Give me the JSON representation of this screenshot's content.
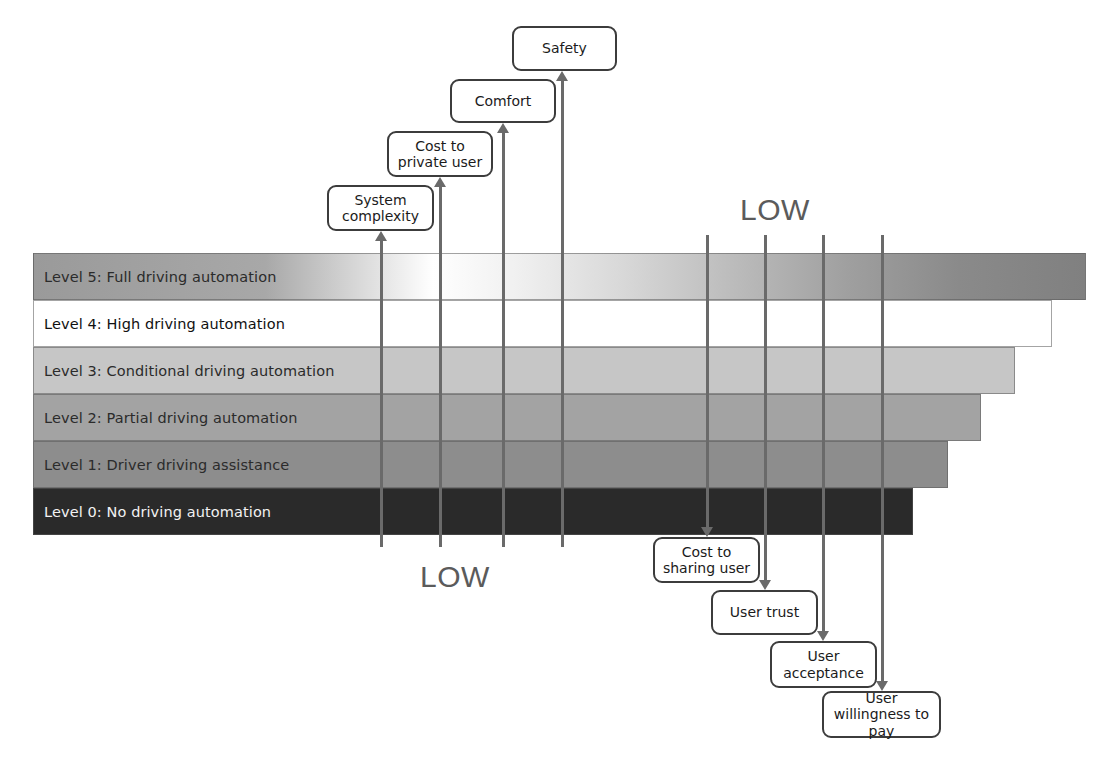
{
  "diagram": {
    "levels": [
      {
        "id": "level-5",
        "label": "Level 5: Full driving automation",
        "text_color": "#2b2b2b",
        "right": 1086,
        "gradient": true
      },
      {
        "id": "level-4",
        "label": "Level 4: High driving automation",
        "text_color": "#111111",
        "right": 1052,
        "fill": "#ffffff"
      },
      {
        "id": "level-3",
        "label": "Level 3: Conditional driving automation",
        "text_color": "#2b2b2b",
        "right": 1015,
        "fill": "#c6c6c6"
      },
      {
        "id": "level-2",
        "label": "Level 2: Partial driving automation",
        "text_color": "#2b2b2b",
        "right": 981,
        "fill": "#a3a3a3"
      },
      {
        "id": "level-1",
        "label": "Level 1: Driver driving assistance",
        "text_color": "#2b2b2b",
        "right": 948,
        "fill": "#8d8d8d"
      },
      {
        "id": "level-0",
        "label": "Level 0: No driving automation",
        "text_color": "#f2f2f2",
        "right": 913,
        "fill": "#2a2a2a"
      }
    ],
    "top_factors": [
      {
        "id": "system-complexity",
        "label": "System complexity",
        "x": 327,
        "y": 185,
        "w": 107,
        "h": 46,
        "line_x": 381
      },
      {
        "id": "cost-private-user",
        "label": "Cost to private user",
        "x": 387,
        "y": 131,
        "w": 106,
        "h": 46,
        "line_x": 440
      },
      {
        "id": "comfort",
        "label": "Comfort",
        "x": 450,
        "y": 79,
        "w": 106,
        "h": 44,
        "line_x": 503
      },
      {
        "id": "safety",
        "label": "Safety",
        "x": 512,
        "y": 26,
        "w": 105,
        "h": 45,
        "line_x": 562
      }
    ],
    "bottom_factors": [
      {
        "id": "cost-sharing-user",
        "label": "Cost to sharing user",
        "x": 653,
        "y": 537,
        "w": 107,
        "h": 46,
        "line_x": 707
      },
      {
        "id": "user-trust",
        "label": "User trust",
        "x": 711,
        "y": 590,
        "w": 107,
        "h": 45,
        "line_x": 765
      },
      {
        "id": "user-acceptance",
        "label": "User acceptance",
        "x": 770,
        "y": 641,
        "w": 107,
        "h": 47,
        "line_x": 823
      },
      {
        "id": "user-willingness-to-pay",
        "label": "User willingness to pay",
        "x": 822,
        "y": 691,
        "w": 119,
        "h": 47,
        "line_x": 882
      }
    ],
    "low_labels": [
      {
        "id": "low-top-right",
        "text": "LOW",
        "x": 740,
        "y": 193
      },
      {
        "id": "low-bottom-left",
        "text": "LOW",
        "x": 420,
        "y": 560
      }
    ],
    "geometry": {
      "bars_left": 33,
      "bars_top": 253,
      "row_height": 47,
      "bar_bottom": 535
    },
    "colors": {
      "line": "#6a6a6a",
      "box_border": "#3c3c3c",
      "low_text": "#5b5b5b",
      "background": "#ffffff"
    }
  }
}
